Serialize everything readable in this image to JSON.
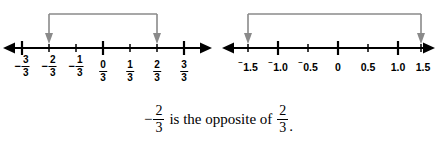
{
  "figure": {
    "kind": "two-number-lines-with-opposite-brackets",
    "background_color": "#ffffff",
    "line_color": "#000000",
    "bracket_color": "#8a8a8a"
  },
  "number_lines": [
    {
      "id": "thirds-number-line",
      "name": "thirds-number-line",
      "axis_start_x": 8,
      "axis_end_x": 207,
      "axis_y": 48,
      "ticks": [
        {
          "label_num": "3",
          "label_den": "3",
          "sign": "−",
          "x": 22,
          "major": true
        },
        {
          "label_num": "2",
          "label_den": "3",
          "sign": "−",
          "x": 49,
          "major": false
        },
        {
          "label_num": "1",
          "label_den": "3",
          "sign": "−",
          "x": 76,
          "major": false
        },
        {
          "label_num": "0",
          "label_den": "3",
          "sign": "",
          "x": 103,
          "major": true
        },
        {
          "label_num": "1",
          "label_den": "3",
          "sign": "",
          "x": 130,
          "major": false
        },
        {
          "label_num": "2",
          "label_den": "3",
          "sign": "",
          "x": 157,
          "major": false
        },
        {
          "label_num": "3",
          "label_den": "3",
          "sign": "",
          "x": 184,
          "major": true
        }
      ],
      "bracket": {
        "from_x": 49,
        "to_x": 157,
        "top_y": 14,
        "arrow_tip_y": 44,
        "from_label": "-2/3",
        "to_label": "2/3"
      }
    },
    {
      "id": "decimals-number-line",
      "name": "decimals-number-line",
      "axis_start_x": 5,
      "axis_end_x": 212,
      "axis_y": 48,
      "ticks": [
        {
          "text": "1.5",
          "raised_sign": "⁻",
          "x": 28,
          "major": false
        },
        {
          "text": "1.0",
          "raised_sign": "⁻",
          "x": 58,
          "major": true
        },
        {
          "text": "0.5",
          "raised_sign": "⁻",
          "x": 88,
          "major": false
        },
        {
          "text": "0",
          "raised_sign": "",
          "x": 118,
          "major": true
        },
        {
          "text": "0.5",
          "raised_sign": "",
          "x": 148,
          "major": false
        },
        {
          "text": "1.0",
          "raised_sign": "",
          "x": 178,
          "major": true
        },
        {
          "text": "1.5",
          "raised_sign": "",
          "x": 201,
          "major": false
        }
      ],
      "bracket": {
        "from_x": 28,
        "to_x": 201,
        "top_y": 14,
        "arrow_tip_y": 44,
        "from_label": "-1.5",
        "to_label": "1.5"
      }
    }
  ],
  "caption": {
    "left_fraction": {
      "sign": "−",
      "numerator": "2",
      "denominator": "3"
    },
    "middle_text": "is the opposite of",
    "right_fraction": {
      "sign": "",
      "numerator": "2",
      "denominator": "3"
    },
    "period": ".",
    "full_text": "−2/3 is the opposite of 2/3."
  }
}
